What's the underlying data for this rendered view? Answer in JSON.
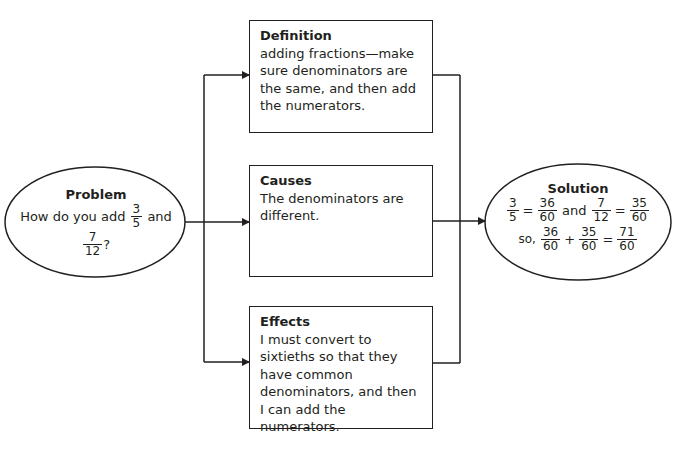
{
  "problem": {
    "title": "Problem",
    "text_before": "How do you add",
    "frac1": {
      "num": "3",
      "den": "5"
    },
    "text_mid": "and",
    "frac2": {
      "num": "7",
      "den": "12"
    },
    "text_after": "?"
  },
  "definition": {
    "title": "Definition",
    "text": "adding fractions—make sure denominators are the same, and then add the numerators."
  },
  "causes": {
    "title": "Causes",
    "text": "The denominators are different."
  },
  "effects": {
    "title": "Effects",
    "text": "I must convert to sixtieths so that they have common denominators, and then I can add the numerators."
  },
  "solution": {
    "title": "Solution",
    "line1": {
      "a": {
        "num": "3",
        "den": "5"
      },
      "eq1": "=",
      "b": {
        "num": "36",
        "den": "60"
      },
      "and": "and",
      "c": {
        "num": "7",
        "den": "12"
      },
      "eq2": "=",
      "d": {
        "num": "35",
        "den": "60"
      }
    },
    "line2": {
      "prefix": "so,",
      "a": {
        "num": "36",
        "den": "60"
      },
      "plus": "+",
      "b": {
        "num": "35",
        "den": "60"
      },
      "eq": "=",
      "c": {
        "num": "71",
        "den": "60"
      }
    }
  }
}
